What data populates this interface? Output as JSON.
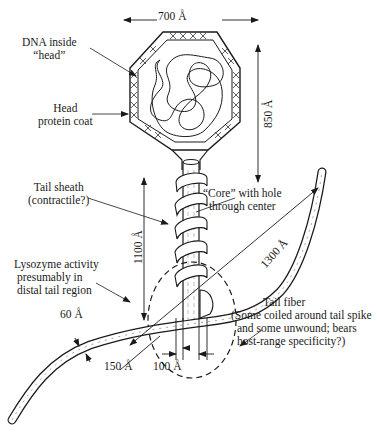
{
  "figure": {
    "labels": {
      "dna_inside_head": [
        "DNA inside",
        "“head”"
      ],
      "head_protein_coat": [
        "Head",
        "protein coat"
      ],
      "tail_sheath": [
        "Tail sheath",
        "(contractile?)"
      ],
      "core": [
        "“Core” with hole",
        "through center"
      ],
      "lysozyme": [
        "Lysozyme activity",
        "presumably in",
        "distal tail region"
      ],
      "tail_fiber": [
        "Tail fiber",
        "(Some coiled around tail spike",
        "and some unwound; bears",
        "host-range specificity?)"
      ]
    },
    "dimensions": {
      "head_width": "700 Å",
      "head_height": "850 Å",
      "tail_length": "1100 Å",
      "fiber_length": "1300 Å",
      "fiber_width": "60 Å",
      "sheath_width": "150 Å",
      "core_width": "100 Å"
    }
  },
  "colors": {
    "ink": "#1a1a1a",
    "background": "#ffffff"
  }
}
